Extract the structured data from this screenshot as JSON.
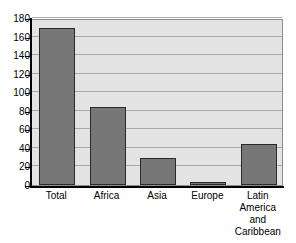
{
  "chart_data": {
    "type": "bar",
    "title": "",
    "subtitle": "",
    "xlabel": "",
    "ylabel": "",
    "categories": [
      "Total",
      "Africa",
      "Asia",
      "Europe",
      "Latin America and Caribbean"
    ],
    "category_display": [
      "Total",
      "Africa",
      "Asia",
      "Europe",
      "Latin\nAmerica\nand\nCaribbean"
    ],
    "values": [
      169,
      84,
      29,
      3,
      44
    ],
    "ylim": [
      0,
      180
    ],
    "yticks": [
      0,
      20,
      40,
      60,
      80,
      100,
      120,
      140,
      160,
      180
    ],
    "ytick_labels": [
      "0",
      "20",
      "40",
      "60",
      "80",
      "100",
      "120",
      "140",
      "160",
      "180"
    ],
    "grid": true,
    "grid_axis": "y",
    "legend": false,
    "legend_position": "none",
    "bar_color": "#777777",
    "bar_edge_color": "#2a2a2a",
    "plot_background": "#e3e3e3",
    "gridline_color": "#a9a9a9",
    "axis_color": "#000000",
    "figure_background": "#ffffff"
  }
}
